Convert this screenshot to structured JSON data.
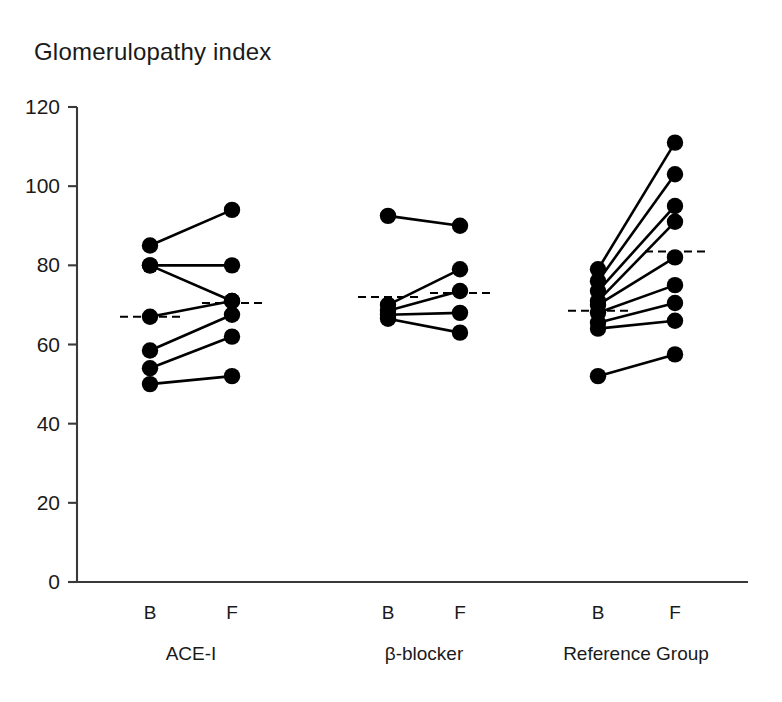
{
  "chart_data": {
    "type": "scatter",
    "title": "Glomerulopathy index",
    "xlabel": "",
    "ylabel": "",
    "ylim": [
      0,
      120
    ],
    "yticks": [
      0,
      20,
      40,
      60,
      80,
      100,
      120
    ],
    "ytick_labels": [
      "0",
      "20",
      "40",
      "60",
      "80",
      "100",
      "120"
    ],
    "grid": false,
    "legend": "none",
    "style": "paired before-after dot plot with connecting lines and dashed group mean markers",
    "timepoint_labels": [
      "B",
      "F"
    ],
    "groups": [
      {
        "name": "ACE-I",
        "b_label": "B",
        "f_label": "F",
        "mean_b": 67,
        "mean_f": 70.5,
        "pairs": [
          {
            "b": 85,
            "f": 94
          },
          {
            "b": 80,
            "f": 80
          },
          {
            "b": 80,
            "f": 71
          },
          {
            "b": 67,
            "f": 71
          },
          {
            "b": 58.5,
            "f": 67.5
          },
          {
            "b": 54,
            "f": 62
          },
          {
            "b": 50,
            "f": 52
          }
        ]
      },
      {
        "name": "β-blocker",
        "b_label": "B",
        "f_label": "F",
        "mean_b": 72,
        "mean_f": 73,
        "pairs": [
          {
            "b": 92.5,
            "f": 90
          },
          {
            "b": 70,
            "f": 79
          },
          {
            "b": 68.5,
            "f": 73.5
          },
          {
            "b": 67.5,
            "f": 68
          },
          {
            "b": 66.5,
            "f": 63
          }
        ]
      },
      {
        "name": "Reference Group",
        "b_label": "B",
        "f_label": "F",
        "mean_b": 68.5,
        "mean_f": 83.5,
        "pairs": [
          {
            "b": 79,
            "f": 111
          },
          {
            "b": 76,
            "f": 103
          },
          {
            "b": 73.5,
            "f": 95
          },
          {
            "b": 71,
            "f": 91
          },
          {
            "b": 70,
            "f": 82
          },
          {
            "b": 68,
            "f": 75
          },
          {
            "b": 65.5,
            "f": 70.5
          },
          {
            "b": 64,
            "f": 66
          },
          {
            "b": 52,
            "f": 57.5
          }
        ]
      }
    ]
  }
}
